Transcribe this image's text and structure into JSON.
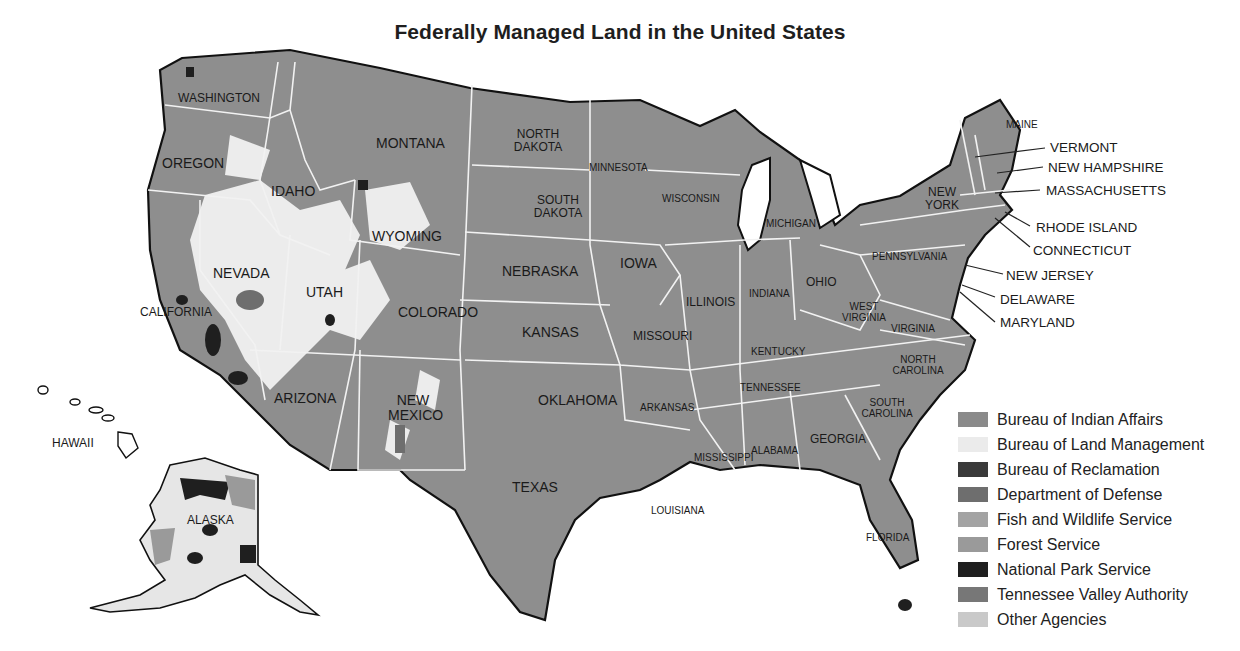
{
  "title": "Federally Managed Land in the United States",
  "colors": {
    "background": "#ffffff",
    "land_default": "#8e8e8e",
    "state_border": "#f2f2f2",
    "coast_outline": "#111111"
  },
  "states": {
    "washington": "WASHINGTON",
    "oregon": "OREGON",
    "california": "CALIFORNIA",
    "idaho": "IDAHO",
    "nevada": "NEVADA",
    "montana": "MONTANA",
    "wyoming": "WYOMING",
    "utah": "UTAH",
    "colorado": "COLORADO",
    "arizona": "ARIZONA",
    "new_mexico": "NEW MEXICO",
    "north_dakota": "NORTH DAKOTA",
    "south_dakota": "SOUTH DAKOTA",
    "nebraska": "NEBRASKA",
    "kansas": "KANSAS",
    "oklahoma": "OKLAHOMA",
    "texas": "TEXAS",
    "minnesota": "MINNESOTA",
    "iowa": "IOWA",
    "missouri": "MISSOURI",
    "arkansas": "ARKANSAS",
    "louisiana": "LOUISIANA",
    "wisconsin": "WISCONSIN",
    "illinois": "ILLINOIS",
    "michigan": "MICHIGAN",
    "indiana": "INDIANA",
    "ohio": "OHIO",
    "kentucky": "KENTUCKY",
    "tennessee": "TENNESSEE",
    "mississippi": "MISSISSIPPI",
    "alabama": "ALABAMA",
    "georgia": "GEORGIA",
    "florida": "FLORIDA",
    "south_carolina": "SOUTH CAROLINA",
    "north_carolina": "NORTH CAROLINA",
    "virginia": "VIRGINIA",
    "west_virginia": "WEST VIRGINIA",
    "pennsylvania": "PENNSYLVANIA",
    "new_york": "NEW YORK",
    "maine": "MAINE",
    "alaska": "ALASKA",
    "hawaii": "HAWAII"
  },
  "callouts": {
    "vermont": "VERMONT",
    "new_hampshire": "NEW HAMPSHIRE",
    "massachusetts": "MASSACHUSETTS",
    "rhode_island": "RHODE ISLAND",
    "connecticut": "CONNECTICUT",
    "new_jersey": "NEW JERSEY",
    "delaware": "DELAWARE",
    "maryland": "MARYLAND"
  },
  "legend": {
    "items": [
      {
        "label": "Bureau of Indian Affairs",
        "color": "#8a8a8a"
      },
      {
        "label": "Bureau of Land Management",
        "color": "#ebebeb"
      },
      {
        "label": "Bureau of Reclamation",
        "color": "#3a3a3a"
      },
      {
        "label": "Department of Defense",
        "color": "#6e6e6e"
      },
      {
        "label": "Fish and Wildlife Service",
        "color": "#a3a3a3"
      },
      {
        "label": "Forest Service",
        "color": "#9a9a9a"
      },
      {
        "label": "National Park Service",
        "color": "#1f1f1f"
      },
      {
        "label": "Tennessee Valley Authority",
        "color": "#777777"
      },
      {
        "label": "Other Agencies",
        "color": "#c9c9c9"
      }
    ]
  }
}
